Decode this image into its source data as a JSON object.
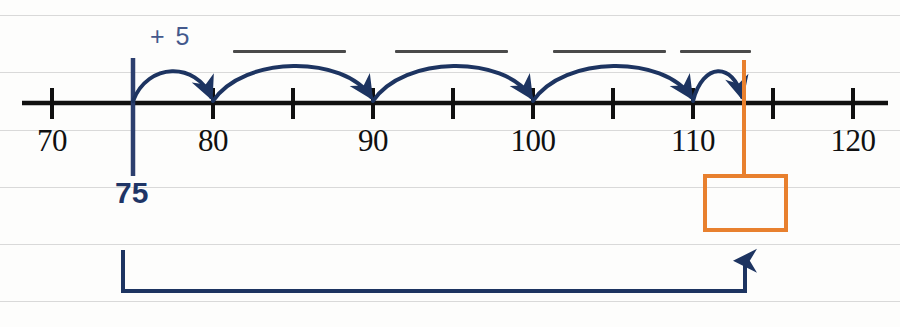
{
  "worksheet": {
    "title": "Number line jumps of 5",
    "colors": {
      "axis": "#101010",
      "jump_arc": "#1d3461",
      "start_marker": "#2c3f6e",
      "answer_box": "#e8802e",
      "total_bracket": "#1d3461",
      "rule_line": "#d9d9d9",
      "blank_line": "#4a4a4a"
    }
  },
  "number_line": {
    "start_value": 70,
    "end_value": 120,
    "minor_step": 5,
    "ticks": [
      {
        "value": 70,
        "x": 52,
        "labelled": true
      },
      {
        "value": 75,
        "x": 133,
        "labelled": false
      },
      {
        "value": 80,
        "x": 213,
        "labelled": true
      },
      {
        "value": 85,
        "x": 293,
        "labelled": false
      },
      {
        "value": 90,
        "x": 373,
        "labelled": true
      },
      {
        "value": 95,
        "x": 453,
        "labelled": false
      },
      {
        "value": 100,
        "x": 533,
        "labelled": true
      },
      {
        "value": 105,
        "x": 613,
        "labelled": false
      },
      {
        "value": 110,
        "x": 693,
        "labelled": true
      },
      {
        "value": 115,
        "x": 773,
        "labelled": false
      },
      {
        "value": 120,
        "x": 853,
        "labelled": true
      }
    ],
    "labels": [
      {
        "text": "70",
        "x": 52
      },
      {
        "text": "80",
        "x": 213
      },
      {
        "text": "90",
        "x": 373
      },
      {
        "text": "100",
        "x": 533
      },
      {
        "text": "110",
        "x": 693
      },
      {
        "text": "120",
        "x": 853
      }
    ]
  },
  "start_marker": {
    "value_label": "75",
    "x": 133
  },
  "jumps": [
    {
      "from": 75,
      "to": 80,
      "x1": 133,
      "x2": 213,
      "peak_y": 68,
      "label": "+ 5"
    },
    {
      "from": 80,
      "to": 90,
      "x1": 213,
      "x2": 373,
      "peak_y": 66,
      "label": ""
    },
    {
      "from": 90,
      "to": 100,
      "x1": 373,
      "x2": 533,
      "peak_y": 66,
      "label": ""
    },
    {
      "from": 100,
      "to": 110,
      "x1": 533,
      "x2": 693,
      "peak_y": 66,
      "label": ""
    },
    {
      "from": 110,
      "to": 113,
      "x1": 693,
      "x2": 744,
      "peak_y": 66,
      "label": ""
    }
  ],
  "step_label": {
    "text": "+ 5",
    "x": 150,
    "y": 22
  },
  "answer_blanks": [
    {
      "x": 233,
      "y": 50,
      "width": 113
    },
    {
      "x": 395,
      "y": 50,
      "width": 113
    },
    {
      "x": 553,
      "y": 50,
      "width": 113
    },
    {
      "x": 680,
      "y": 50,
      "width": 71
    }
  ],
  "answer_box": {
    "x": 703,
    "y": 174,
    "width": 85,
    "height": 58,
    "value": "",
    "connector_x": 744,
    "connector_top": 103,
    "connector_bottom": 174
  },
  "total_bracket": {
    "left_x": 123,
    "right_x": 745,
    "top_y": 250,
    "bottom_y": 292
  },
  "rule_lines_y": [
    15,
    72,
    130,
    187,
    244,
    301
  ]
}
